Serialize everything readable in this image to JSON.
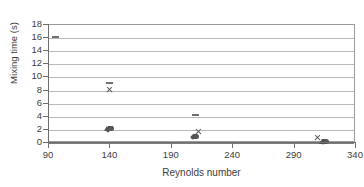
{
  "chart_data": {
    "type": "scatter",
    "title": "",
    "xlabel": "Reynolds number",
    "ylabel": "Mixing time (s)",
    "xlim": [
      90,
      340
    ],
    "ylim": [
      0,
      18
    ],
    "xticks": [
      90,
      140,
      190,
      240,
      290,
      340
    ],
    "yticks": [
      0,
      2,
      4,
      6,
      8,
      10,
      12,
      14,
      16,
      18
    ],
    "grid": "horizontal",
    "legend": "none",
    "series": [
      {
        "name": "dash",
        "marker": "dash",
        "color": "#6f6f6f",
        "points": [
          {
            "x": 95,
            "y": 16.2
          },
          {
            "x": 139,
            "y": 9.2
          },
          {
            "x": 209,
            "y": 4.2
          }
        ]
      },
      {
        "name": "cross",
        "marker": "cross",
        "color": "#5d5d5d",
        "points": [
          {
            "x": 139,
            "y": 8.1
          },
          {
            "x": 212,
            "y": 1.7
          },
          {
            "x": 309,
            "y": 0.85
          }
        ]
      },
      {
        "name": "triangle",
        "marker": "triangle",
        "color": "#4f4f4f",
        "points": [
          {
            "x": 137,
            "y": 2.25
          },
          {
            "x": 208,
            "y": 1.0
          },
          {
            "x": 312,
            "y": 0.2
          }
        ]
      },
      {
        "name": "square",
        "marker": "square",
        "color": "#4a4a4a",
        "points": [
          {
            "x": 140,
            "y": 2.3
          },
          {
            "x": 209,
            "y": 1.05
          },
          {
            "x": 314,
            "y": 0.2
          }
        ]
      },
      {
        "name": "diamond",
        "marker": "diamond",
        "color": "#535353",
        "points": [
          {
            "x": 138,
            "y": 2.05
          },
          {
            "x": 207,
            "y": 0.95
          },
          {
            "x": 313,
            "y": 0.15
          }
        ]
      },
      {
        "name": "circle",
        "marker": "circle",
        "color": "#585858",
        "points": [
          {
            "x": 141,
            "y": 2.2
          },
          {
            "x": 210,
            "y": 1.0
          },
          {
            "x": 316,
            "y": 0.2
          }
        ]
      }
    ]
  }
}
